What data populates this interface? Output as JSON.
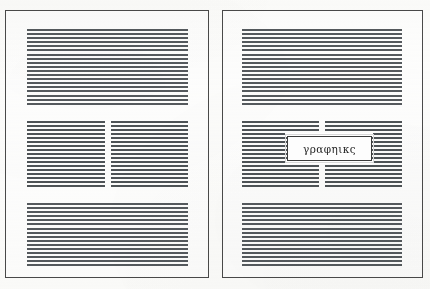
{
  "figure": {
    "background_color": "#fdfdfc",
    "border_color": "#4a4a4a",
    "rule_color": "#555a5e"
  },
  "pages": [
    {
      "id": "page-left",
      "name": "page-without-caption",
      "blocks": [
        {
          "name": "top-full-width-text-block",
          "lines": 19,
          "columns": 1
        },
        {
          "name": "middle-two-column-text-block",
          "lines": 17,
          "columns": 2
        },
        {
          "name": "bottom-full-width-text-block",
          "lines": 20,
          "columns": 1
        }
      ]
    },
    {
      "id": "page-right",
      "name": "page-with-caption",
      "blocks": [
        {
          "name": "top-full-width-text-block",
          "lines": 19,
          "columns": 1
        },
        {
          "name": "middle-two-column-text-block",
          "lines": 17,
          "columns": 2
        },
        {
          "name": "bottom-full-width-text-block",
          "lines": 20,
          "columns": 1
        }
      ],
      "caption": {
        "name": "caption-box",
        "text": "γραφηικς",
        "border_color": "#3b3b3b",
        "background_color": "#fdfdfd"
      }
    }
  ]
}
